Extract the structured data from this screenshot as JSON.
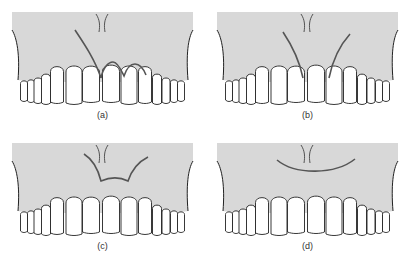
{
  "figure": {
    "panels": [
      {
        "id": "a",
        "label": "(a)",
        "incision": "papilla-sparing-scalloped"
      },
      {
        "id": "b",
        "label": "(b)",
        "incision": "two-vertical-releasing"
      },
      {
        "id": "c",
        "label": "(c)",
        "incision": "papilla-trapezoid"
      },
      {
        "id": "d",
        "label": "(d)",
        "incision": "semilunar"
      }
    ],
    "colors": {
      "gingiva": "#d8d8d8",
      "tooth": "#ffffff",
      "outline": "#222222",
      "incision": "#555555"
    }
  }
}
